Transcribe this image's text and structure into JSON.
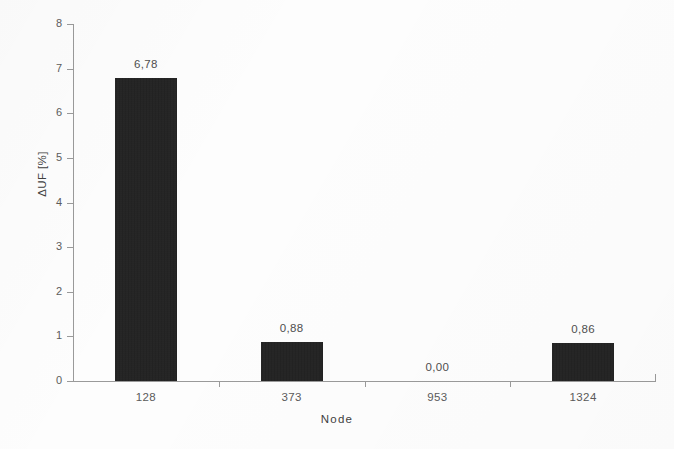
{
  "chart_data": {
    "type": "bar",
    "title": "",
    "subtitle": "",
    "xlabel": "Node",
    "ylabel": "ΔUF [%]",
    "categories": [
      "128",
      "373",
      "953",
      "1324"
    ],
    "values": [
      6.78,
      0.88,
      0.0,
      0.86
    ],
    "value_labels": [
      "6,78",
      "0,88",
      "0,00",
      "0,86"
    ],
    "series": [
      {
        "name": "",
        "values": [
          6.78,
          0.88,
          0.0,
          0.86
        ]
      }
    ],
    "ylim": [
      0,
      8
    ],
    "xlim_categories": 4,
    "y_ticks": [
      0,
      1,
      2,
      3,
      4,
      5,
      6,
      7,
      8
    ],
    "y_tick_labels": [
      "0",
      "1",
      "2",
      "3",
      "4",
      "5",
      "6",
      "7",
      "8"
    ],
    "grid": false,
    "legend": null,
    "legend_position": "none",
    "bar_color": "#1c1c1c",
    "axis_color": "#9a9a9a",
    "text_color": "#4f4f4f",
    "decimal_separator": ",",
    "annotations": []
  },
  "axis": {
    "y_title": "ΔUF [%]",
    "x_title": "Node"
  }
}
